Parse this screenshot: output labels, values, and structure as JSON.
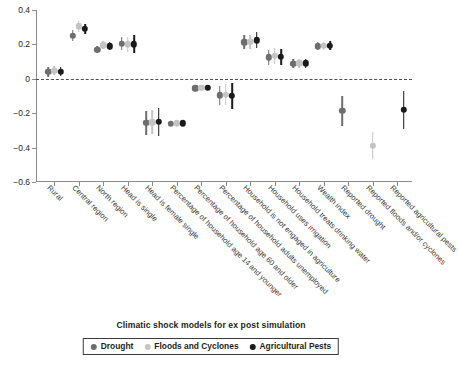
{
  "chart_data": {
    "type": "scatter",
    "title": "",
    "xlabel": "Climatic shock models for ex post simulation",
    "ylabel": "",
    "ylim": [
      -0.6,
      0.4
    ],
    "yticks": [
      "0.4",
      "0.2",
      "0",
      "−0.2",
      "−0.4",
      "−0.6"
    ],
    "ytick_values": [
      0.4,
      0.2,
      0,
      -0.2,
      -0.4,
      -0.6
    ],
    "grid": false,
    "zero_reference_line": true,
    "legend_position": "bottom",
    "categories": [
      "Rural",
      "Central region",
      "North region",
      "Head is single",
      "Head is female single",
      "Percentage of household age 14 and younger",
      "Percentage of household age 60 and older",
      "Percentage of household adults unemployed",
      "Household is not engaged in agriculture",
      "Household uses irrigation",
      "Household treats drinking water",
      "Wealth index",
      "Reported drought",
      "Reported floods and/or cyclones",
      "Reported agricultural pests"
    ],
    "series": [
      {
        "name": "Drought",
        "color": "#6e6e6e",
        "values": [
          0.04,
          0.25,
          0.17,
          0.205,
          -0.255,
          -0.26,
          -0.055,
          -0.095,
          0.212,
          0.125,
          0.088,
          0.19,
          -0.185,
          null,
          null
        ],
        "ci_low": [
          0.012,
          0.218,
          0.15,
          0.165,
          -0.325,
          -0.268,
          -0.065,
          -0.15,
          0.172,
          0.082,
          0.062,
          0.165,
          -0.275,
          null,
          null
        ],
        "ci_high": [
          0.068,
          0.282,
          0.192,
          0.245,
          -0.188,
          -0.252,
          -0.045,
          -0.042,
          0.252,
          0.168,
          0.115,
          0.215,
          -0.098,
          null,
          null
        ]
      },
      {
        "name": "Floods and Cyclones",
        "color": "#c4c4c4",
        "values": [
          0.048,
          0.305,
          0.195,
          0.2,
          -0.252,
          -0.258,
          -0.052,
          -0.092,
          0.215,
          0.132,
          0.09,
          0.192,
          null,
          -0.39,
          null
        ],
        "ci_low": [
          0.022,
          0.272,
          0.172,
          0.158,
          -0.322,
          -0.266,
          -0.062,
          -0.152,
          0.175,
          0.085,
          0.062,
          0.168,
          null,
          -0.468,
          null
        ],
        "ci_high": [
          0.074,
          0.338,
          0.218,
          0.242,
          -0.182,
          -0.25,
          -0.042,
          -0.032,
          0.255,
          0.18,
          0.118,
          0.216,
          null,
          -0.312,
          null
        ]
      },
      {
        "name": "Agricultural Pests",
        "color": "#1a1a1a",
        "values": [
          0.041,
          0.29,
          0.19,
          0.2,
          -0.25,
          -0.258,
          -0.052,
          -0.1,
          0.224,
          0.128,
          0.09,
          0.192,
          null,
          null,
          -0.18
        ],
        "ci_low": [
          0.016,
          0.262,
          0.168,
          0.148,
          -0.332,
          -0.266,
          -0.062,
          -0.175,
          0.178,
          0.08,
          0.062,
          0.165,
          null,
          null,
          -0.29
        ],
        "ci_high": [
          0.066,
          0.318,
          0.212,
          0.252,
          -0.168,
          -0.25,
          -0.042,
          -0.025,
          0.27,
          0.176,
          0.118,
          0.219,
          null,
          null,
          -0.07
        ]
      }
    ]
  },
  "caption": {
    "text": "Climatic shock models for ex post simulation"
  },
  "legend": {
    "items": [
      {
        "label": "Drought",
        "color": "#6e6e6e"
      },
      {
        "label": "Floods and Cyclones",
        "color": "#c4c4c4"
      },
      {
        "label": "Agricultural Pests",
        "color": "#1a1a1a"
      }
    ]
  }
}
